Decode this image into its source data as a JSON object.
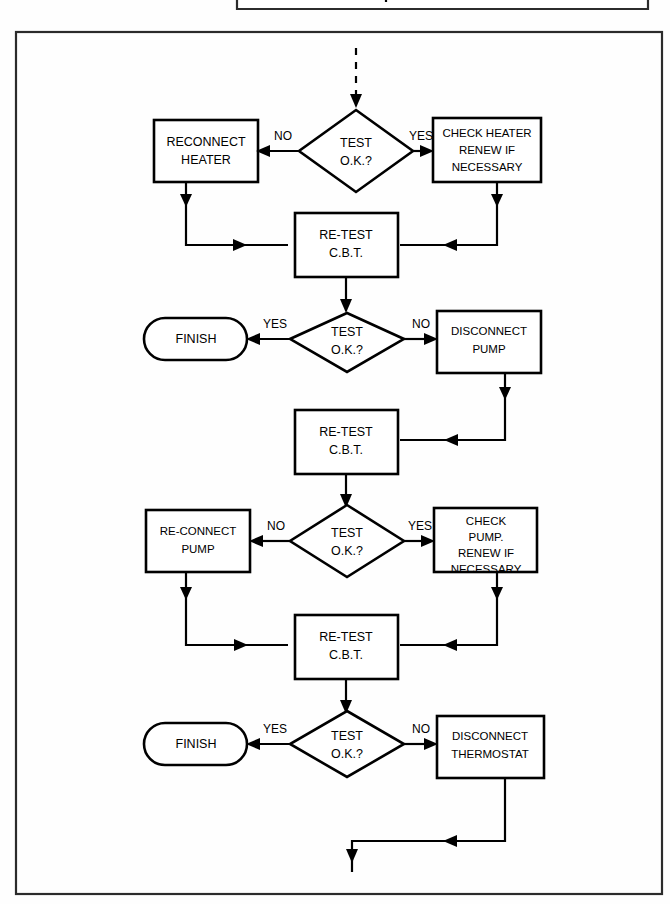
{
  "page": {
    "width": 670,
    "height": 904,
    "background_color": "#ffffff",
    "line_color": "#000000"
  },
  "diagram": {
    "type": "flowchart",
    "orientation": "top-to-bottom",
    "entry": {
      "style": "dashed-arrow",
      "note": "continuation from previous page"
    },
    "exit": {
      "style": "solid-arrow",
      "note": "continues to next page"
    },
    "nodes": [
      {
        "id": "decision-heater",
        "shape": "diamond",
        "lines": [
          "TEST",
          "O.K.?"
        ],
        "line1": "TEST",
        "line2": "O.K.?"
      },
      {
        "id": "reconnect-heater",
        "shape": "rectangle",
        "lines": [
          "RECONNECT",
          "HEATER"
        ],
        "line1": "RECONNECT",
        "line2": "HEATER"
      },
      {
        "id": "check-heater",
        "shape": "rectangle",
        "lines": [
          "CHECK HEATER",
          "RENEW IF",
          "NECESSARY"
        ],
        "line1": "CHECK HEATER",
        "line2": "RENEW IF",
        "line3": "NECESSARY"
      },
      {
        "id": "retest-1",
        "shape": "rectangle",
        "lines": [
          "RE-TEST",
          "C.B.T."
        ],
        "line1": "RE-TEST",
        "line2": "C.B.T."
      },
      {
        "id": "decision-pump",
        "shape": "diamond",
        "lines": [
          "TEST",
          "O.K.?"
        ],
        "line1": "TEST",
        "line2": "O.K.?"
      },
      {
        "id": "finish-1",
        "shape": "stadium",
        "lines": [
          "FINISH"
        ],
        "line1": "FINISH"
      },
      {
        "id": "disconnect-pump",
        "shape": "rectangle",
        "lines": [
          "DISCONNECT",
          "PUMP"
        ],
        "line1": "DISCONNECT",
        "line2": "PUMP"
      },
      {
        "id": "retest-2",
        "shape": "rectangle",
        "lines": [
          "RE-TEST",
          "C.B.T."
        ],
        "line1": "RE-TEST",
        "line2": "C.B.T."
      },
      {
        "id": "decision-pump-2",
        "shape": "diamond",
        "lines": [
          "TEST",
          "O.K.?"
        ],
        "line1": "TEST",
        "line2": "O.K.?"
      },
      {
        "id": "reconnect-pump",
        "shape": "rectangle",
        "lines": [
          "RE-CONNECT",
          "PUMP"
        ],
        "line1": "RE-CONNECT",
        "line2": "PUMP"
      },
      {
        "id": "check-pump",
        "shape": "rectangle",
        "lines": [
          "CHECK",
          "PUMP.",
          "RENEW IF",
          "NECESSARY"
        ],
        "line1": "CHECK",
        "line2": "PUMP.",
        "line3": "RENEW IF",
        "line4": "NECESSARY"
      },
      {
        "id": "retest-3",
        "shape": "rectangle",
        "lines": [
          "RE-TEST",
          "C.B.T."
        ],
        "line1": "RE-TEST",
        "line2": "C.B.T."
      },
      {
        "id": "decision-thermostat",
        "shape": "diamond",
        "lines": [
          "TEST",
          "O.K.?"
        ],
        "line1": "TEST",
        "line2": "O.K.?"
      },
      {
        "id": "finish-2",
        "shape": "stadium",
        "lines": [
          "FINISH"
        ],
        "line1": "FINISH"
      },
      {
        "id": "disconnect-thermostat",
        "shape": "rectangle",
        "lines": [
          "DISCONNECT",
          "THERMOSTAT"
        ],
        "line1": "DISCONNECT",
        "line2": "THERMOSTAT"
      }
    ],
    "edge_labels": {
      "no_1": "NO",
      "yes_1": "YES",
      "yes_2": "YES",
      "no_2": "NO",
      "no_3": "NO",
      "yes_3": "YES",
      "yes_4": "YES",
      "no_4": "NO"
    }
  }
}
